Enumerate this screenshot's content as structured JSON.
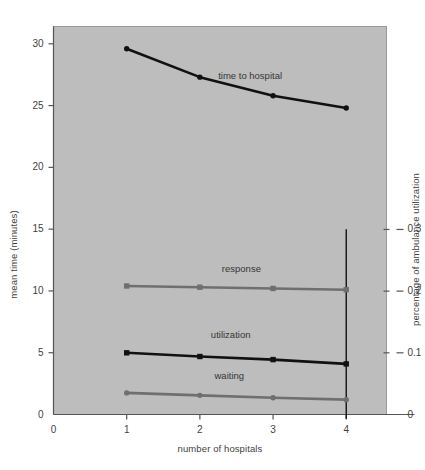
{
  "chart_data": {
    "type": "line",
    "title": "",
    "xlabel": "number of hospitals",
    "ylabel": "mean time (minutes)",
    "ylabel_right": "percentage of ambulance utilization",
    "x": [
      1,
      2,
      3,
      4
    ],
    "xlim": [
      0,
      4.55
    ],
    "ylim": [
      0,
      31.4
    ],
    "ylim_right": [
      0,
      0.629
    ],
    "xticks": [
      "0",
      "1",
      "2",
      "3",
      "4"
    ],
    "xtick_values": [
      0,
      1,
      2,
      3,
      4
    ],
    "yticks_left": [
      "0",
      "5",
      "10",
      "15",
      "20",
      "25",
      "30"
    ],
    "ytick_left_values": [
      0,
      5,
      10,
      15,
      20,
      25,
      30
    ],
    "yticks_right": [
      "0",
      "0.1",
      "0.2",
      "0.3"
    ],
    "ytick_right_values": [
      0,
      0.1,
      0.2,
      0.3
    ],
    "grid": false,
    "legend": "inline-labels",
    "plot_background": "#bdbdbd",
    "series": [
      {
        "name": "time to hospital",
        "axis": "left",
        "color": "#111111",
        "marker": "circle",
        "values": [
          29.6,
          27.3,
          25.8,
          24.8
        ],
        "label_x": 2.25,
        "label_y": 27.3
      },
      {
        "name": "response",
        "axis": "left",
        "color": "#6f6f6f",
        "marker": "square",
        "values": [
          10.4,
          10.3,
          10.2,
          10.1
        ],
        "label_x": 2.3,
        "label_y": 11.7
      },
      {
        "name": "utilization",
        "axis": "right",
        "color": "#111111",
        "marker": "square",
        "values": [
          0.1,
          0.094,
          0.089,
          0.082
        ],
        "label_x": 2.15,
        "label_y": 0.128
      },
      {
        "name": "waiting",
        "axis": "left",
        "color": "#6f6f6f",
        "marker": "circle",
        "values": [
          1.75,
          1.55,
          1.35,
          1.2
        ],
        "label_x": 2.2,
        "label_y": 3.0
      }
    ],
    "annotations": [
      {
        "name": "vertical-reference-line",
        "x": 4,
        "y_from": 15.0,
        "y_to": -0.35,
        "color": "#111111"
      }
    ]
  }
}
